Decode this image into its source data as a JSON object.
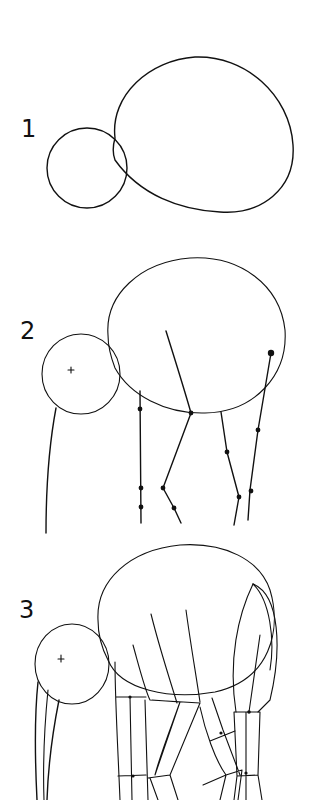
{
  "steps": [
    {
      "number": "1",
      "description": "Head circle and body oval"
    },
    {
      "number": "2",
      "description": "Head center mark, trunk line and leg guide lines with joints"
    },
    {
      "number": "3",
      "description": "Trunk, leg segments and hind quarter shapes"
    }
  ],
  "colors": {
    "stroke": "#111111",
    "background": "#ffffff"
  }
}
